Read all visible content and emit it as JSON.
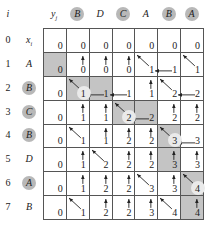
{
  "diagram": {
    "header": {
      "i_label": "i",
      "y_label": "y",
      "y_sub": "j",
      "columns": [
        {
          "label": "B",
          "highlighted": true
        },
        {
          "label": "D",
          "highlighted": false
        },
        {
          "label": "C",
          "highlighted": true
        },
        {
          "label": "A",
          "highlighted": false
        },
        {
          "label": "B",
          "highlighted": true
        },
        {
          "label": "A",
          "highlighted": true
        }
      ]
    },
    "rows": [
      {
        "i": "0",
        "x": "x",
        "x_sub": "i",
        "highlighted": false
      },
      {
        "i": "1",
        "x": "A",
        "highlighted": false
      },
      {
        "i": "2",
        "x": "B",
        "highlighted": true
      },
      {
        "i": "3",
        "x": "C",
        "highlighted": true
      },
      {
        "i": "4",
        "x": "B",
        "highlighted": true
      },
      {
        "i": "5",
        "x": "D",
        "highlighted": false
      },
      {
        "i": "6",
        "x": "A",
        "highlighted": true
      },
      {
        "i": "7",
        "x": "B",
        "highlighted": false
      }
    ],
    "colors": {
      "shade": "#c4c4c4",
      "circle": "#b8b8b8",
      "grid_line": "#555555"
    },
    "cells": [
      [
        {
          "v": "0"
        },
        {
          "v": "0"
        },
        {
          "v": "0"
        },
        {
          "v": "0"
        },
        {
          "v": "0"
        },
        {
          "v": "0"
        },
        {
          "v": "0"
        }
      ],
      [
        {
          "v": "0",
          "shade": true
        },
        {
          "v": "0",
          "a": "up"
        },
        {
          "v": "0",
          "a": "up"
        },
        {
          "v": "0",
          "a": "up"
        },
        {
          "v": "1",
          "a": "diag"
        },
        {
          "v": "1",
          "a": "left"
        },
        {
          "v": "1",
          "a": "diag"
        }
      ],
      [
        {
          "v": "0"
        },
        {
          "v": "1",
          "a": "diag",
          "shade": true,
          "hl": true
        },
        {
          "v": "1",
          "a": "left",
          "shade": true
        },
        {
          "v": "1",
          "a": "left"
        },
        {
          "v": "1",
          "a": "up"
        },
        {
          "v": "2",
          "a": "diag"
        },
        {
          "v": "2",
          "a": "left"
        }
      ],
      [
        {
          "v": "0"
        },
        {
          "v": "1",
          "a": "up"
        },
        {
          "v": "1",
          "a": "up"
        },
        {
          "v": "2",
          "a": "diag",
          "shade": true,
          "hl": true
        },
        {
          "v": "2",
          "a": "left",
          "shade": true
        },
        {
          "v": "2",
          "a": "up"
        },
        {
          "v": "2",
          "a": "up"
        }
      ],
      [
        {
          "v": "0"
        },
        {
          "v": "1",
          "a": "diag"
        },
        {
          "v": "1",
          "a": "up"
        },
        {
          "v": "2",
          "a": "up"
        },
        {
          "v": "2",
          "a": "up"
        },
        {
          "v": "3",
          "a": "diag",
          "shade": true,
          "hl": true
        },
        {
          "v": "3",
          "a": "left"
        }
      ],
      [
        {
          "v": "0"
        },
        {
          "v": "1",
          "a": "up"
        },
        {
          "v": "2",
          "a": "diag"
        },
        {
          "v": "2",
          "a": "up"
        },
        {
          "v": "2",
          "a": "up"
        },
        {
          "v": "3",
          "a": "up",
          "shade": true
        },
        {
          "v": "3",
          "a": "up"
        }
      ],
      [
        {
          "v": "0"
        },
        {
          "v": "1",
          "a": "up"
        },
        {
          "v": "2",
          "a": "up"
        },
        {
          "v": "2",
          "a": "up"
        },
        {
          "v": "3",
          "a": "diag"
        },
        {
          "v": "3",
          "a": "up"
        },
        {
          "v": "4",
          "a": "diag",
          "shade": true,
          "hl": true
        }
      ],
      [
        {
          "v": "0"
        },
        {
          "v": "1",
          "a": "diag"
        },
        {
          "v": "2",
          "a": "up"
        },
        {
          "v": "2",
          "a": "up"
        },
        {
          "v": "3",
          "a": "up"
        },
        {
          "v": "4",
          "a": "diag"
        },
        {
          "v": "4",
          "a": "up",
          "shade": true
        }
      ]
    ]
  }
}
